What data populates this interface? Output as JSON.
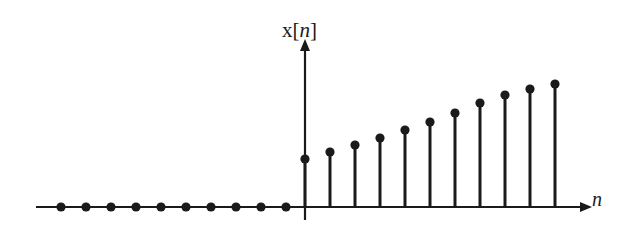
{
  "figure": {
    "kind": "discrete-time-signal-stem-plot",
    "background_color": "#ffffff",
    "ink_color": "#1a1a1a"
  },
  "labels": {
    "y_axis": "x[n]",
    "x_axis": "n"
  },
  "geometry": {
    "baseline_y": 207,
    "origin_x": 305,
    "sample_spacing_px": 25,
    "y_axis_top_y": 48,
    "x_axis_left_x": 36,
    "x_axis_right_x": 583,
    "dot_radius_px": 4.6,
    "stem_width_px": 3,
    "axis_width_px": 2.2
  },
  "chart_data": {
    "type": "line",
    "title": "",
    "subtitle": "",
    "xlabel": "n",
    "ylabel": "x[n]",
    "grid": false,
    "legend": null,
    "annotations": [],
    "axis_style": "arrow-ended single axes through origin",
    "xlim": [
      -10,
      11
    ],
    "ylim": [
      0,
      1.1
    ],
    "x": [
      -10,
      -9,
      -8,
      -7,
      -6,
      -5,
      -4,
      -3,
      -2,
      -1,
      0,
      1,
      2,
      3,
      4,
      5,
      6,
      7,
      8,
      9,
      10
    ],
    "values": [
      0,
      0,
      0,
      0,
      0,
      0,
      0,
      0,
      0,
      0,
      0.4,
      0.45,
      0.5,
      0.55,
      0.6,
      0.65,
      0.72,
      0.78,
      0.85,
      0.92,
      1.0
    ],
    "series": [
      {
        "name": "x[n]",
        "x": [
          -10,
          -9,
          -8,
          -7,
          -6,
          -5,
          -4,
          -3,
          -2,
          -1,
          0,
          1,
          2,
          3,
          4,
          5,
          6,
          7,
          8,
          9,
          10
        ],
        "values": [
          0,
          0,
          0,
          0,
          0,
          0,
          0,
          0,
          0,
          0,
          0.4,
          0.45,
          0.5,
          0.55,
          0.6,
          0.65,
          0.72,
          0.78,
          0.85,
          0.92,
          1.0
        ]
      }
    ],
    "zero_samples_count": 10,
    "nonzero_samples_count": 11,
    "stem_pixel_tops": [
      159,
      152,
      145,
      138,
      130,
      122,
      113,
      103,
      95,
      89,
      84
    ],
    "zero_dot_pixel_x": [
      61,
      86,
      111,
      136,
      161,
      186,
      211,
      236,
      261,
      286
    ],
    "stem_pixel_x": [
      305,
      330,
      355,
      380,
      405,
      430,
      455,
      480,
      505,
      530,
      555
    ]
  }
}
